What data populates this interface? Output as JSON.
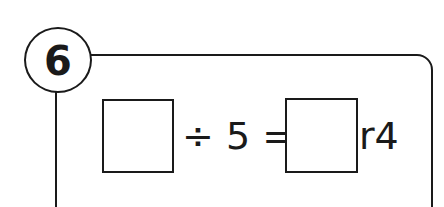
{
  "question": {
    "number": "6",
    "equation": {
      "divisor_part": "÷ 5 =",
      "remainder": "r4",
      "dividend_box": "",
      "quotient_box": ""
    }
  }
}
